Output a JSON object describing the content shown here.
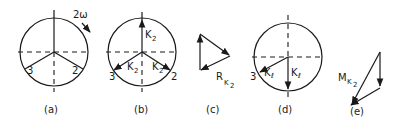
{
  "diagram": {
    "panels": [
      {
        "id": "a",
        "caption": "(a)",
        "rotation_label": "2ω",
        "point_labels": [
          "3",
          "2"
        ]
      },
      {
        "id": "b",
        "caption": "(b)",
        "vector_label_main": "K",
        "vector_label_sub": "2",
        "point_labels": [
          "3",
          "2"
        ]
      },
      {
        "id": "c",
        "caption": "(c)",
        "resultant_main": "R",
        "resultant_sub1": "K",
        "resultant_sub2": "2"
      },
      {
        "id": "d",
        "caption": "(d)",
        "vector_label_main": "K",
        "vector_label_sub": "ℓ",
        "point_labels": [
          "3"
        ]
      },
      {
        "id": "e",
        "caption": "(e)",
        "resultant_main": "M",
        "resultant_sub1": "K",
        "resultant_sub2": "2"
      }
    ],
    "colors": {
      "ink": "#1a1a1a",
      "background": "#ffffff"
    }
  }
}
